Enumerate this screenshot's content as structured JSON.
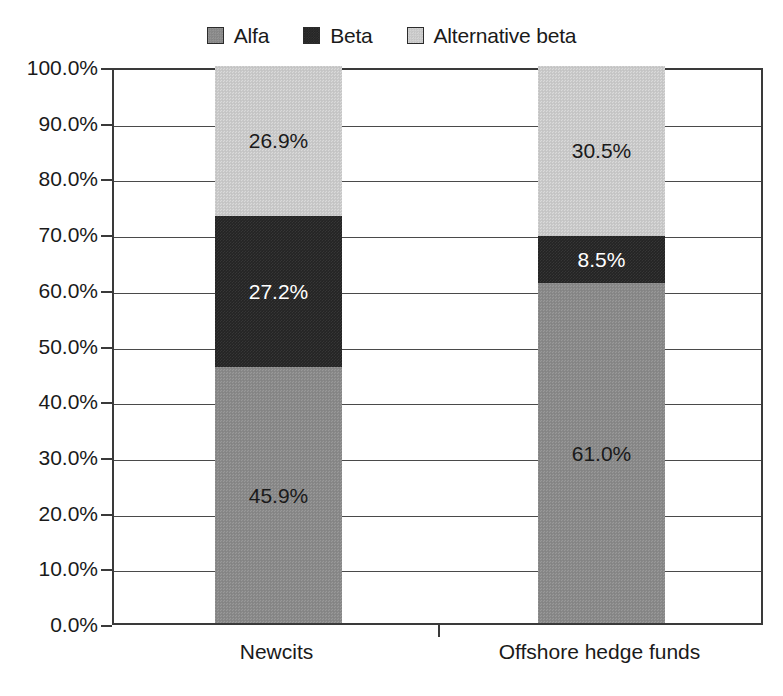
{
  "chart_data": {
    "type": "bar",
    "subtype": "stacked-100-percent",
    "title": "",
    "subtitle": "",
    "xlabel": "",
    "ylabel": "",
    "categories": [
      "Newcits",
      "Offshore hedge funds"
    ],
    "series": [
      {
        "name": "Alfa",
        "values": [
          45.9,
          61.0
        ],
        "labels": [
          "45.9%",
          "61.0%"
        ],
        "color": "#8a8a8a",
        "label_color": "#1a1a1a"
      },
      {
        "name": "Beta",
        "values": [
          27.2,
          8.5
        ],
        "labels": [
          "27.2%",
          "8.5%"
        ],
        "color": "#242424",
        "label_color": "#ffffff"
      },
      {
        "name": "Alternative beta",
        "values": [
          26.9,
          30.5
        ],
        "labels": [
          "26.9%",
          "30.5%"
        ],
        "color": "#cacaca",
        "label_color": "#1a1a1a"
      }
    ],
    "stack_order_bottom_to_top": [
      "Alfa",
      "Beta",
      "Alternative beta"
    ],
    "ylim": [
      0,
      100
    ],
    "ytick_values": [
      0,
      10,
      20,
      30,
      40,
      50,
      60,
      70,
      80,
      90,
      100
    ],
    "ytick_labels": [
      "100.0%",
      "90.0%",
      "80.0%",
      "70.0%",
      "60.0%",
      "50.0%",
      "40.0%",
      "30.0%",
      "20.0%",
      "10.0%",
      "0.0%"
    ],
    "grid": true,
    "grid_axis": "y",
    "legend": true,
    "legend_position": "top-center"
  },
  "legend": {
    "items": [
      {
        "label": "Alfa",
        "swatch": "alfa"
      },
      {
        "label": "Beta",
        "swatch": "beta"
      },
      {
        "label": "Alternative beta",
        "swatch": "altbeta"
      }
    ]
  },
  "yaxis": {
    "ticks": [
      {
        "label": "100.0%",
        "value": 100
      },
      {
        "label": "90.0%",
        "value": 90
      },
      {
        "label": "80.0%",
        "value": 80
      },
      {
        "label": "70.0%",
        "value": 70
      },
      {
        "label": "60.0%",
        "value": 60
      },
      {
        "label": "50.0%",
        "value": 50
      },
      {
        "label": "40.0%",
        "value": 40
      },
      {
        "label": "30.0%",
        "value": 30
      },
      {
        "label": "20.0%",
        "value": 20
      },
      {
        "label": "10.0%",
        "value": 10
      },
      {
        "label": "0.0%",
        "value": 0
      }
    ]
  },
  "xaxis": {
    "categories": [
      {
        "label": "Newcits"
      },
      {
        "label": "Offshore hedge funds"
      }
    ]
  },
  "bars": [
    {
      "category": "Newcits",
      "segments": [
        {
          "series": "Alternative beta",
          "value": 26.9,
          "label": "26.9%",
          "fill": "altbeta",
          "text": "dark-text"
        },
        {
          "series": "Beta",
          "value": 27.2,
          "label": "27.2%",
          "fill": "beta",
          "text": "light-text"
        },
        {
          "series": "Alfa",
          "value": 45.9,
          "label": "45.9%",
          "fill": "alfa",
          "text": "dark-text"
        }
      ]
    },
    {
      "category": "Offshore hedge funds",
      "segments": [
        {
          "series": "Alternative beta",
          "value": 30.5,
          "label": "30.5%",
          "fill": "altbeta",
          "text": "dark-text"
        },
        {
          "series": "Beta",
          "value": 8.5,
          "label": "8.5%",
          "fill": "beta",
          "text": "light-text"
        },
        {
          "series": "Alfa",
          "value": 61.0,
          "label": "61.0%",
          "fill": "alfa",
          "text": "dark-text"
        }
      ]
    }
  ],
  "colors": {
    "alfa": "#8a8a8a",
    "beta": "#242424",
    "altbeta": "#cacaca",
    "axis": "#3a3a3a",
    "grid": "#4a4a4a",
    "background": "#ffffff",
    "text": "#1a1a1a"
  }
}
